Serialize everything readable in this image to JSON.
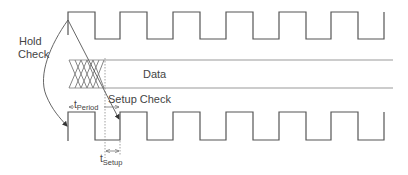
{
  "diagram": {
    "type": "timing-diagram",
    "labels": {
      "hold_line1": "Hold",
      "hold_line2": "Check",
      "data": "Data",
      "setup_check": "Setup Check",
      "t_period_main": "t",
      "t_period_sub": "Period",
      "t_setup_main": "t",
      "t_setup_sub": "Setup"
    },
    "signals": [
      {
        "name": "launch-clock",
        "kind": "clock",
        "high_y": 12,
        "low_y": 39,
        "start_x": 68,
        "end_x": 384,
        "period_px": 52.6
      },
      {
        "name": "data-bus",
        "kind": "bus",
        "top_y": 60,
        "bottom_y": 88,
        "start_x": 69,
        "end_x": 393,
        "transition_end_x": 104
      },
      {
        "name": "capture-clock",
        "kind": "clock",
        "high_y": 112,
        "low_y": 140,
        "start_x": 68,
        "end_x": 384,
        "period_px": 52.6
      }
    ],
    "colors": {
      "waveform": "#555555",
      "bus": "#9a9a9a",
      "text": "#444444"
    }
  }
}
